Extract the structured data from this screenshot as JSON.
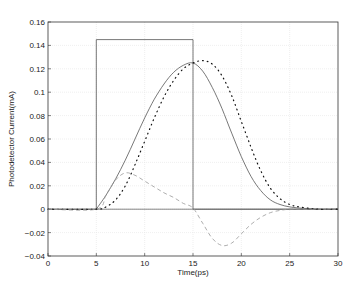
{
  "chart_data": {
    "type": "line",
    "title": "",
    "xlabel": "Time(ps)",
    "ylabel": "Photodetector Current(mA)",
    "xlim": [
      0,
      30
    ],
    "ylim": [
      -0.04,
      0.16
    ],
    "xticks": [
      0,
      5,
      10,
      15,
      20,
      25,
      30
    ],
    "yticks": [
      -0.04,
      -0.02,
      0,
      0.02,
      0.04,
      0.06,
      0.08,
      0.1,
      0.12,
      0.14,
      0.16
    ],
    "xtick_labels": [
      "0",
      "5",
      "10",
      "15",
      "20",
      "25",
      "30"
    ],
    "ytick_labels": [
      "-0.04",
      "-0.02",
      "0",
      "0.02",
      "0.04",
      "0.06",
      "0.08",
      "0.1",
      "0.12",
      "0.14",
      "0.16"
    ],
    "grid": true,
    "legend": null,
    "series": [
      {
        "name": "rectangular pulse",
        "style": "solid",
        "x": [
          0,
          5,
          5,
          15,
          15,
          30
        ],
        "y": [
          0,
          0,
          0.145,
          0.145,
          0,
          0
        ]
      },
      {
        "name": "solid curve",
        "style": "solid",
        "x": [
          5,
          6,
          7,
          8,
          9,
          10,
          11,
          12,
          13,
          14,
          15,
          16,
          17,
          18,
          19,
          20,
          21,
          22,
          23,
          24,
          25,
          26,
          28,
          30
        ],
        "y": [
          0,
          0.012,
          0.026,
          0.042,
          0.06,
          0.078,
          0.094,
          0.107,
          0.117,
          0.123,
          0.125,
          0.118,
          0.104,
          0.086,
          0.065,
          0.045,
          0.028,
          0.016,
          0.008,
          0.004,
          0.002,
          0.001,
          0,
          0
        ]
      },
      {
        "name": "dotted curve",
        "style": "dotted",
        "x": [
          0,
          5,
          6,
          7,
          8,
          9,
          10,
          11,
          12,
          13,
          14,
          15,
          16,
          17,
          18,
          19,
          20,
          21,
          22,
          23,
          24,
          25,
          26,
          28,
          30
        ],
        "y": [
          0,
          0,
          0.002,
          0.008,
          0.02,
          0.038,
          0.058,
          0.078,
          0.096,
          0.11,
          0.12,
          0.125,
          0.127,
          0.124,
          0.114,
          0.097,
          0.075,
          0.053,
          0.033,
          0.018,
          0.009,
          0.004,
          0.002,
          0,
          0
        ]
      },
      {
        "name": "dashed curve",
        "style": "dashed",
        "x": [
          0,
          5,
          6,
          7,
          8,
          9,
          10,
          11,
          12,
          13,
          14,
          15,
          16,
          17,
          18,
          19,
          20,
          21,
          22,
          23,
          24,
          25,
          26,
          28,
          30
        ],
        "y": [
          0,
          0,
          0.012,
          0.025,
          0.031,
          0.029,
          0.024,
          0.019,
          0.014,
          0.01,
          0.005,
          0.001,
          -0.012,
          -0.025,
          -0.031,
          -0.029,
          -0.021,
          -0.013,
          -0.007,
          -0.003,
          -0.001,
          0,
          0,
          0,
          0
        ]
      }
    ]
  }
}
